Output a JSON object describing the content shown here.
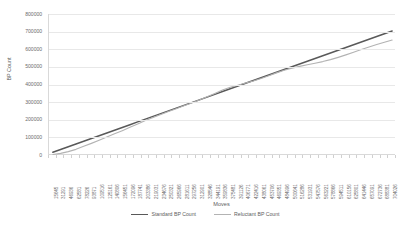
{
  "chart_data": {
    "type": "line",
    "title": "",
    "xlabel": "Moves",
    "ylabel": "BP Count",
    "ylim": [
      0,
      800000
    ],
    "y_ticks": [
      0,
      100000,
      200000,
      300000,
      400000,
      500000,
      600000,
      700000,
      800000
    ],
    "y_tick_labels": [
      "0",
      "100000",
      "200000",
      "300000",
      "400000",
      "500000",
      "600000",
      "700000",
      "800000"
    ],
    "grid": true,
    "legend_position": "bottom",
    "categories": [
      "15645",
      "31291",
      "46936",
      "62581",
      "78226",
      "93871",
      "109516",
      "125161",
      "140806",
      "156451",
      "172096",
      "187741",
      "203386",
      "219031",
      "234676",
      "250321",
      "265966",
      "281611",
      "297256",
      "312901",
      "328546",
      "344191",
      "359836",
      "375481",
      "391126",
      "406771",
      "422416",
      "438061",
      "453706",
      "469351",
      "484996",
      "500641",
      "516286",
      "531931",
      "547576",
      "563221",
      "578866",
      "594511",
      "610156",
      "625801",
      "641446",
      "657091",
      "672736",
      "688381",
      "704026"
    ],
    "series": [
      {
        "name": "Standard BP Count",
        "color": "#595959",
        "values": [
          15645,
          31291,
          46936,
          62581,
          78226,
          93871,
          109516,
          125161,
          140806,
          156451,
          172096,
          187741,
          203386,
          219031,
          234676,
          250321,
          265966,
          281611,
          297256,
          312901,
          328546,
          344191,
          359836,
          375481,
          391126,
          406771,
          422416,
          438061,
          453706,
          469351,
          484996,
          500641,
          516286,
          531931,
          547576,
          563221,
          578866,
          594511,
          610156,
          625801,
          641446,
          657091,
          672736,
          688381,
          704026
        ]
      },
      {
        "name": "Reluctant BP Count",
        "color": "#b3b3b3",
        "values": [
          3000,
          9000,
          19000,
          32000,
          49000,
          66000,
          84000,
          102000,
          120000,
          138000,
          157000,
          176000,
          196000,
          213000,
          230000,
          247000,
          263000,
          279000,
          295000,
          312000,
          330000,
          349000,
          369000,
          384000,
          396000,
          408000,
          420000,
          434000,
          450000,
          466000,
          481000,
          493000,
          503000,
          512000,
          521000,
          530000,
          541000,
          554000,
          568000,
          583000,
          598000,
          613000,
          627000,
          640000,
          652000
        ]
      }
    ]
  },
  "legend": {
    "items": [
      {
        "label": "Standard BP Count",
        "color": "#595959"
      },
      {
        "label": "Reluctant BP Count",
        "color": "#b3b3b3"
      }
    ]
  }
}
